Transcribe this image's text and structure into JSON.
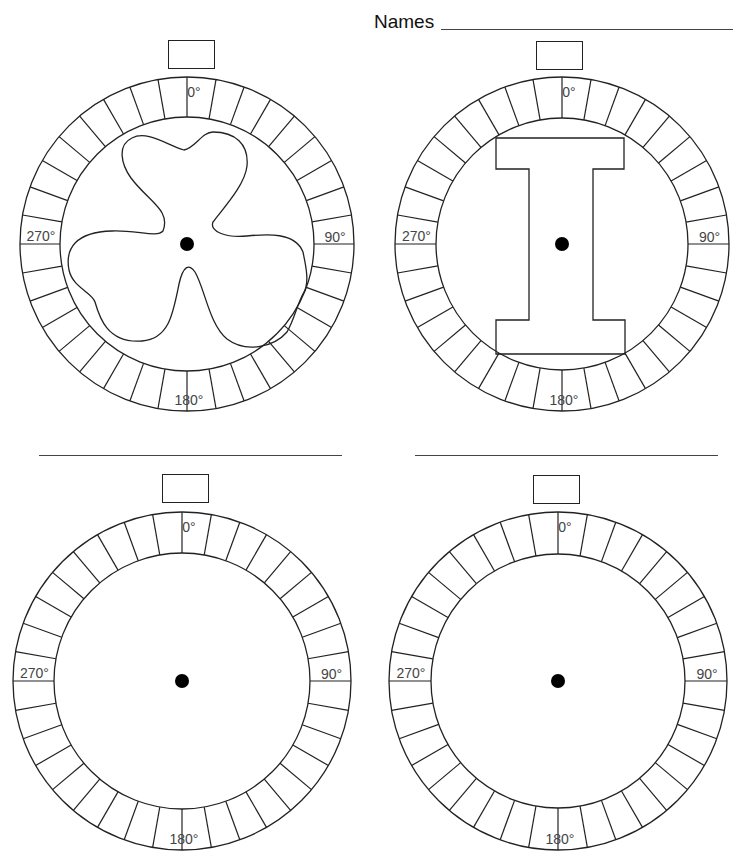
{
  "header": {
    "names_label": "Names",
    "names_value": ""
  },
  "ring": {
    "segments": 36,
    "degrees_per_segment": 10,
    "labels": {
      "top": "0°",
      "right": "90°",
      "bottom": "180°",
      "left": "270°"
    }
  },
  "wheels": [
    {
      "id": "wheel-1",
      "shape": "three-lobed-propeller",
      "answer_value": "",
      "line_value": null
    },
    {
      "id": "wheel-2",
      "shape": "letter-I",
      "answer_value": "",
      "line_value": null
    },
    {
      "id": "wheel-3",
      "shape": "none",
      "answer_value": "",
      "line_value": ""
    },
    {
      "id": "wheel-4",
      "shape": "none",
      "answer_value": "",
      "line_value": ""
    }
  ]
}
